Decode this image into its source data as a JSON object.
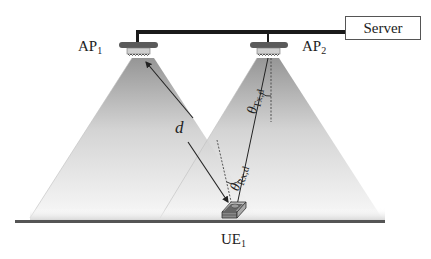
{
  "server": {
    "label": "Server"
  },
  "access_points": [
    {
      "name": "AP",
      "sub": "1"
    },
    {
      "name": "AP",
      "sub": "2"
    }
  ],
  "user_equipment": {
    "name": "UE",
    "sub": "1"
  },
  "labels": {
    "distance": "d",
    "theta_tx": {
      "symbol": "θ",
      "sub": "Tx,d"
    },
    "theta_rx": {
      "symbol": "θ",
      "sub": "Rx,d"
    }
  },
  "colors": {
    "cable": "#1a1a1a",
    "cone_top": "#8c8c8c",
    "cone_bottom": "#f4f4f4",
    "floor": "#555555",
    "ap_body": "#5a5a5a"
  }
}
